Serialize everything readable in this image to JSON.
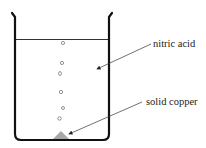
{
  "diagram": {
    "labels": {
      "nitric_acid": "nitric acid",
      "solid_copper": "solid copper"
    },
    "colors": {
      "beaker": "#111111",
      "liquid_surface": "#333333",
      "copper": "#a8a8a8",
      "arrow": "#333333",
      "bubble": "#666666"
    },
    "bubbles": [
      {
        "x": 63,
        "y": 43
      },
      {
        "x": 62,
        "y": 63
      },
      {
        "x": 60,
        "y": 73.5
      },
      {
        "x": 61,
        "y": 92
      },
      {
        "x": 63,
        "y": 108
      },
      {
        "x": 59.5,
        "y": 118.5
      }
    ]
  }
}
